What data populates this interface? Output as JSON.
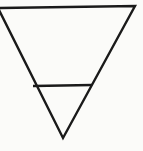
{
  "figure": {
    "title": "Inverted triangle with horizontal crossbar",
    "background_color": "#fbfbf9",
    "line_color": "#1a1a1a",
    "canvas": {
      "width": 143,
      "height": 151
    }
  },
  "shapes": {
    "outer_triangle": {
      "name": "inverted-triangle",
      "orientation": "point-down",
      "stroke_color": "#1a1a1a",
      "stroke_width": 2.4,
      "fill": "none",
      "vertices": [
        {
          "label": "top-left",
          "x": -2,
          "y": 8
        },
        {
          "label": "top-right",
          "x": 135,
          "y": 6
        },
        {
          "label": "bottom-apex",
          "x": 63,
          "y": 138
        }
      ]
    },
    "crossbar": {
      "name": "horizontal-crossbar",
      "stroke_color": "#1a1a1a",
      "stroke_width": 2.4,
      "start": {
        "x": 33,
        "y": 86
      },
      "end": {
        "x": 92,
        "y": 85
      }
    },
    "inner_triangle": {
      "name": "inner-small-triangle",
      "orientation": "point-down",
      "note": "Region bounded by the crossbar and the lower parts of the two slanted sides",
      "vertices": [
        {
          "label": "left",
          "x": 33,
          "y": 86
        },
        {
          "label": "right",
          "x": 92,
          "y": 85
        },
        {
          "label": "bottom-apex",
          "x": 63,
          "y": 138
        }
      ]
    }
  }
}
